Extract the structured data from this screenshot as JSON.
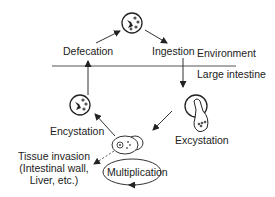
{
  "diagram": {
    "labels": {
      "defecation": "Defecation",
      "ingestion": "Ingestion",
      "environment": "Environment",
      "large_intestine": "Large intestine",
      "encystation": "Encystation",
      "excystation": "Excystation",
      "tissue_invasion_line1": "Tissue invasion",
      "tissue_invasion_line2": "(Intestinal wall,",
      "tissue_invasion_line3": "Liver, etc.)",
      "multiplication": "Multiplication"
    },
    "colors": {
      "line": "#333333",
      "text": "#222222",
      "background": "#ffffff"
    }
  }
}
